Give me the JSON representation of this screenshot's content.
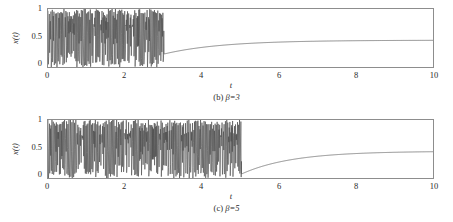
{
  "figure": {
    "background": "#ffffff",
    "frame_color": "#8d8d8d",
    "trace_color": "#4a4a4a",
    "smooth_color": "#6f6f6f"
  },
  "panels": [
    {
      "id": "panel-b",
      "caption_index": "(b)",
      "caption_param": "β=3",
      "caption_full": "(b) β=3",
      "ylabel": "x(t)",
      "xlabel": "t",
      "yticks": [
        "0",
        "0.5",
        "1"
      ],
      "xticks": [
        "0",
        "2",
        "4",
        "6",
        "8",
        "10"
      ]
    },
    {
      "id": "panel-c",
      "caption_index": "(c)",
      "caption_param": "β=5",
      "caption_full": "(c) β=5",
      "ylabel": "x(t)",
      "xlabel": "t",
      "yticks": [
        "0",
        "0.5",
        "1"
      ],
      "xticks": [
        "0",
        "2",
        "4",
        "6",
        "8",
        "10"
      ]
    }
  ],
  "chart_data": [
    {
      "type": "line",
      "title": "(b) β=3",
      "xlabel": "t",
      "ylabel": "x(t)",
      "xlim": [
        0,
        10
      ],
      "ylim": [
        0,
        1
      ],
      "xticks": [
        0,
        2,
        4,
        6,
        8,
        10
      ],
      "yticks": [
        0,
        0.5,
        1
      ],
      "grid": false,
      "legend": "none",
      "annotations": [
        "chaotic regime for t < 3",
        "control switched on at t = 3",
        "settles to steady state x ≈ 0.48"
      ],
      "series": [
        {
          "name": "x(t), beta=3",
          "chaotic_phase": {
            "t_start": 0,
            "t_end": 3.0,
            "min": 0.0,
            "max": 1.0,
            "mean": 0.5,
            "description": "dense irregular oscillation filling 0 to 1"
          },
          "settling_phase": {
            "t_start": 3.0,
            "t_end": 10.0,
            "value_at_start": 0.25,
            "asymptote": 0.48,
            "time_constant": 1.5,
            "description": "monotone exponential approach to steady state"
          },
          "sampled_points": [
            {
              "t": 3.0,
              "x": 0.25
            },
            {
              "t": 3.5,
              "x": 0.316
            },
            {
              "t": 4.0,
              "x": 0.369
            },
            {
              "t": 4.5,
              "x": 0.404
            },
            {
              "t": 5.0,
              "x": 0.428
            },
            {
              "t": 5.5,
              "x": 0.445
            },
            {
              "t": 6.0,
              "x": 0.456
            },
            {
              "t": 7.0,
              "x": 0.468
            },
            {
              "t": 8.0,
              "x": 0.474
            },
            {
              "t": 9.0,
              "x": 0.477
            },
            {
              "t": 10.0,
              "x": 0.479
            }
          ]
        }
      ]
    },
    {
      "type": "line",
      "title": "(c) β=5",
      "xlabel": "t",
      "ylabel": "x(t)",
      "xlim": [
        0,
        10
      ],
      "ylim": [
        0,
        1
      ],
      "xticks": [
        0,
        2,
        4,
        6,
        8,
        10
      ],
      "yticks": [
        0,
        0.5,
        1
      ],
      "grid": false,
      "legend": "none",
      "annotations": [
        "chaotic regime for t < 5",
        "control switched on at t = 5",
        "settles to steady state x ≈ 0.48"
      ],
      "series": [
        {
          "name": "x(t), beta=5",
          "chaotic_phase": {
            "t_start": 0,
            "t_end": 5.0,
            "min": 0.0,
            "max": 1.0,
            "mean": 0.5,
            "description": "dense irregular oscillation filling 0 to 1"
          },
          "settling_phase": {
            "t_start": 5.0,
            "t_end": 10.0,
            "value_at_start": 0.1,
            "asymptote": 0.48,
            "time_constant": 1.3,
            "description": "monotone exponential approach to steady state"
          },
          "sampled_points": [
            {
              "t": 5.0,
              "x": 0.1
            },
            {
              "t": 5.5,
              "x": 0.205
            },
            {
              "t": 6.0,
              "x": 0.285
            },
            {
              "t": 6.5,
              "x": 0.34
            },
            {
              "t": 7.0,
              "x": 0.38
            },
            {
              "t": 7.5,
              "x": 0.409
            },
            {
              "t": 8.0,
              "x": 0.429
            },
            {
              "t": 8.5,
              "x": 0.443
            },
            {
              "t": 9.0,
              "x": 0.453
            },
            {
              "t": 9.5,
              "x": 0.461
            },
            {
              "t": 10.0,
              "x": 0.466
            }
          ]
        }
      ]
    }
  ]
}
